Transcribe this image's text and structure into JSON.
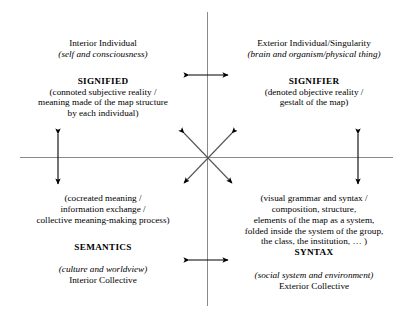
{
  "diagram": {
    "type": "four-quadrant-matrix",
    "title_visible": false,
    "colors": {
      "axis": "#8a8a8a",
      "arrow": "#000000",
      "text": "#000000",
      "background": "#ffffff"
    },
    "quadrants": {
      "top_left": {
        "perspective_name": "Interior Individual",
        "perspective_gloss": "(self and consciousness)",
        "term": "SIGNIFIED",
        "description_lines": [
          "(connoted subjective reality /",
          "meaning made of the map structure",
          "by each individual)"
        ]
      },
      "top_right": {
        "perspective_name": "Exterior Individual/Singularity",
        "perspective_gloss": "(brain and organism/physical thing)",
        "term": "SIGNIFIER",
        "description_lines": [
          "(denoted objective reality /",
          "gestalt of the map)"
        ]
      },
      "bottom_left": {
        "description_lines": [
          "(cocreated meaning /",
          "information exchange /",
          "collective meaning-making process)"
        ],
        "term": "SEMANTICS",
        "perspective_gloss": "(culture and worldview)",
        "perspective_name": "Interior Collective"
      },
      "bottom_right": {
        "description_lines": [
          "(visual grammar and syntax /",
          "composition, structure,",
          "elements of the map as a system,",
          "folded inside the system of the group,",
          "the class, the institution, … )"
        ],
        "term": "SYNTAX",
        "perspective_gloss": "(social system and environment)",
        "perspective_name": "Exterior Collective"
      }
    },
    "arrows": [
      {
        "name": "upper-horizontal-double-arrow",
        "orientation": "horizontal",
        "heads": "both"
      },
      {
        "name": "lower-horizontal-double-arrow",
        "orientation": "horizontal",
        "heads": "both"
      },
      {
        "name": "left-vertical-double-arrow",
        "orientation": "vertical",
        "heads": "both"
      },
      {
        "name": "right-vertical-double-arrow",
        "orientation": "vertical",
        "heads": "both"
      },
      {
        "name": "center-diagonal-double-arrow-nw-se",
        "orientation": "diagonal",
        "heads": "both"
      },
      {
        "name": "center-diagonal-double-arrow-ne-sw",
        "orientation": "diagonal",
        "heads": "both"
      }
    ]
  }
}
